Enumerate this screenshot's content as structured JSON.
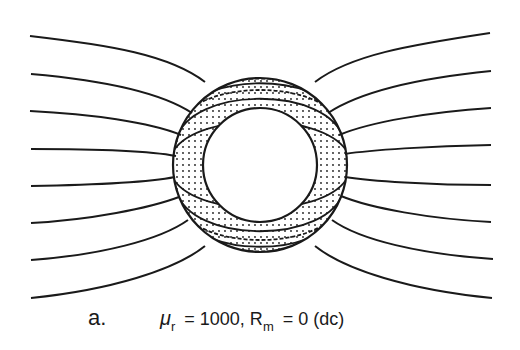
{
  "figure": {
    "label": "a.",
    "mu_symbol": "μ",
    "mu_subscript": "r",
    "mu_value": " = 1000, R",
    "rm_subscript": "m",
    "rm_value": " =  0 (dc)",
    "cylinder": {
      "center": [
        260,
        165
      ],
      "outer_radius": 87,
      "inner_radius": 57
    },
    "field_lines_left_y": [
      36,
      74,
      111,
      149,
      186,
      223,
      260,
      298
    ],
    "field_lines_right_y": [
      36,
      74,
      111,
      149,
      186,
      223,
      260,
      298
    ],
    "colors": {
      "ink": "#1a1a1a",
      "background": "#ffffff"
    }
  }
}
